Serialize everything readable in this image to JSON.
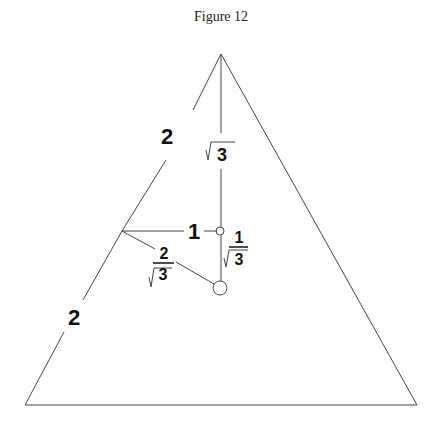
{
  "title": "Figure 12",
  "labels": {
    "upper_left_side": "2",
    "lower_left_side": "2",
    "upper_altitude": "3",
    "horizontal_segment": "1",
    "slant_segment_num": "2",
    "slant_segment_den": "3",
    "short_altitude_num": "1",
    "short_altitude_den": "3"
  }
}
